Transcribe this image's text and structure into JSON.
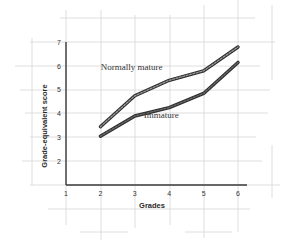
{
  "chart_data": {
    "type": "line",
    "title": "",
    "xlabel": "Grades",
    "ylabel": "Grade-equivalent score",
    "x_ticks": [
      "1",
      "2",
      "3",
      "4",
      "5",
      "6"
    ],
    "y_ticks": [
      "2",
      "3",
      "4",
      "5",
      "6",
      "7"
    ],
    "xlim": [
      1,
      6
    ],
    "ylim": [
      1,
      7
    ],
    "grid": true,
    "legend_position": "inline labels",
    "x": [
      2,
      3,
      4,
      5,
      6
    ],
    "series": [
      {
        "name": "Normally mature",
        "values": [
          3.45,
          4.75,
          5.4,
          5.8,
          6.8
        ],
        "color": "#6e6e6e"
      },
      {
        "name": "Immature",
        "values": [
          3.05,
          3.9,
          4.25,
          4.85,
          6.15
        ],
        "color": "#3c3c3c"
      }
    ],
    "annotations": [
      {
        "text": "Normally mature",
        "x": 3.0,
        "y": 5.85
      },
      {
        "text": "Immature",
        "x": 4.25,
        "y": 3.8
      }
    ]
  }
}
